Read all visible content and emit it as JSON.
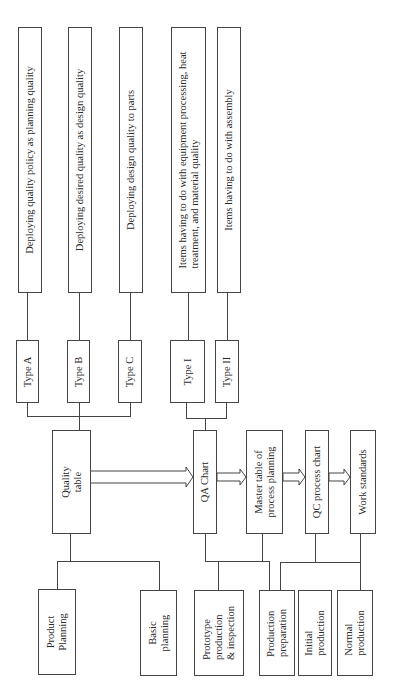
{
  "diagram": {
    "deploy_boxes": [
      {
        "label": "Deploying quality policy as planning quality"
      },
      {
        "label": "Deploying desired quality as design quality"
      },
      {
        "label": "Deploying design quality to parts"
      },
      {
        "label_line1": "Items having to do with equipment processing, heat",
        "label_line2": "treatment, and material quality"
      },
      {
        "label": "Items having to do with assembly"
      }
    ],
    "type_boxes": [
      "Type A",
      "Type B",
      "Type C",
      "Type I",
      "Type II"
    ],
    "quality_table": {
      "line1": "Quality",
      "line2": "table"
    },
    "process_boxes": [
      {
        "label": "QA Chart"
      },
      {
        "line1": "Master table of",
        "line2": "process planning"
      },
      {
        "label": "QC process chart"
      },
      {
        "label": "Work standards"
      }
    ],
    "bottom_boxes": [
      {
        "line1": "Product",
        "line2": "Planning"
      },
      {
        "line1": "Basic",
        "line2": "planning"
      },
      {
        "line1": "Prototype",
        "line2": "production",
        "line3": "& inspection"
      },
      {
        "line1": "Production",
        "line2": "preparation"
      },
      {
        "line1": "Initial",
        "line2": "production"
      },
      {
        "line1": "Normal",
        "line2": "production"
      }
    ]
  }
}
